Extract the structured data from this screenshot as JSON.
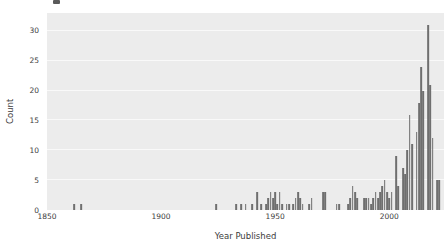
{
  "chart_data": {
    "type": "bar",
    "subtype": "histogram",
    "title": "",
    "xlabel": "Year Published",
    "ylabel": "Count",
    "xlim": [
      1850,
      2024
    ],
    "ylim": [
      0,
      33
    ],
    "xticks": [
      1850,
      1900,
      1950,
      2000
    ],
    "yticks": [
      0,
      5,
      10,
      15,
      20,
      25,
      30
    ],
    "grid": "horizontal-white-lines",
    "legend": "none",
    "plot_bg_color": "#ececec",
    "grid_color": "#f9f9f9",
    "bar_color": "#6f6f6f",
    "tick_label_color": "#3c3c3c",
    "bins_format": "[year, count]",
    "bins": [
      [
        1862,
        1
      ],
      [
        1865,
        1
      ],
      [
        1924,
        1
      ],
      [
        1933,
        1
      ],
      [
        1935,
        1
      ],
      [
        1937,
        1
      ],
      [
        1940,
        1
      ],
      [
        1942,
        3
      ],
      [
        1944,
        1
      ],
      [
        1946,
        1
      ],
      [
        1947,
        2
      ],
      [
        1948,
        3
      ],
      [
        1949,
        2
      ],
      [
        1950,
        3
      ],
      [
        1951,
        1
      ],
      [
        1952,
        3
      ],
      [
        1953,
        1
      ],
      [
        1955,
        1
      ],
      [
        1956,
        1
      ],
      [
        1958,
        1
      ],
      [
        1959,
        2
      ],
      [
        1960,
        3
      ],
      [
        1961,
        2
      ],
      [
        1962,
        1
      ],
      [
        1965,
        1
      ],
      [
        1966,
        2
      ],
      [
        1971,
        3
      ],
      [
        1972,
        3
      ],
      [
        1977,
        1
      ],
      [
        1978,
        1
      ],
      [
        1982,
        1
      ],
      [
        1983,
        2
      ],
      [
        1984,
        4
      ],
      [
        1985,
        3
      ],
      [
        1986,
        2
      ],
      [
        1989,
        2
      ],
      [
        1990,
        2
      ],
      [
        1991,
        2
      ],
      [
        1992,
        1
      ],
      [
        1993,
        2
      ],
      [
        1994,
        3
      ],
      [
        1995,
        2
      ],
      [
        1996,
        3
      ],
      [
        1997,
        4
      ],
      [
        1998,
        5
      ],
      [
        1999,
        3
      ],
      [
        2000,
        2
      ],
      [
        2001,
        3
      ],
      [
        2003,
        9
      ],
      [
        2004,
        4
      ],
      [
        2006,
        7
      ],
      [
        2007,
        6
      ],
      [
        2008,
        10
      ],
      [
        2009,
        16
      ],
      [
        2010,
        11
      ],
      [
        2012,
        13
      ],
      [
        2013,
        18
      ],
      [
        2014,
        24
      ],
      [
        2015,
        20
      ],
      [
        2017,
        31
      ],
      [
        2018,
        21
      ],
      [
        2019,
        12
      ],
      [
        2021,
        5
      ],
      [
        2022,
        5
      ]
    ]
  }
}
